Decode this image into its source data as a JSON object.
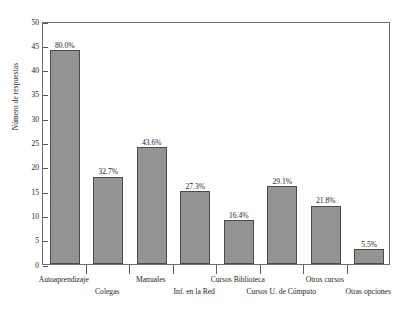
{
  "chart_data": {
    "type": "bar",
    "title": "",
    "subtitle": "",
    "xlabel": "",
    "ylabel": "Número de respuestas",
    "ylim": [
      0,
      50
    ],
    "ytick_values": [
      0,
      5,
      10,
      15,
      20,
      25,
      30,
      35,
      40,
      45,
      50
    ],
    "ytick_labels": [
      "0",
      "5",
      "10",
      "15",
      "20",
      "25",
      "30",
      "35",
      "40",
      "45",
      "50"
    ],
    "grid": false,
    "legend": "none",
    "categories": [
      "Autoaprendizaje",
      "Colegas",
      "Manuales",
      "Inf. en la Red",
      "Cursos Biblioteca",
      "Cursos U. de Cómputo",
      "Otros cursos",
      "Otras opciones"
    ],
    "values": [
      44,
      18,
      24,
      15,
      9,
      16,
      12,
      3
    ],
    "data_labels": [
      "80.0%",
      "32.7%",
      "43.6%",
      "27.3%",
      "16.4%",
      "29.1%",
      "21.8%",
      "5.5%"
    ],
    "bar_color": "#949494",
    "bar_border_color": "#4a4a4a",
    "axis_color": "#6e6e6e",
    "background_color": "#ffffff",
    "label_rows": [
      0,
      1,
      0,
      1,
      0,
      1,
      0,
      1
    ]
  }
}
